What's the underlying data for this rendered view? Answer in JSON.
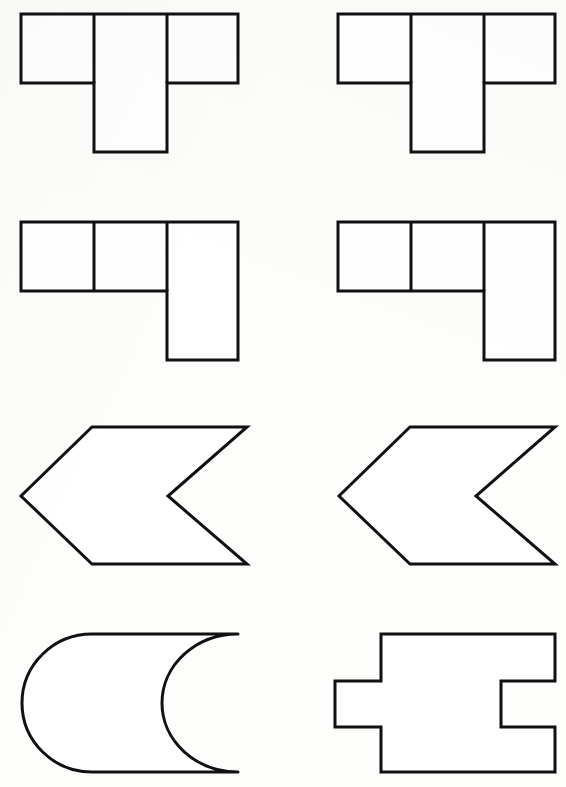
{
  "document": {
    "title": "Geometric Shape Worksheet",
    "background_color": "#fdfdfb",
    "stroke_color": "#111111",
    "fill_color": "#ffffff",
    "stroke_width": 3,
    "width": 566,
    "height": 787,
    "layout": "2 columns x 4 rows of line-drawn outline figures"
  },
  "figures": [
    {
      "id": "figure-r1c1",
      "name": "t-pentomino-outline",
      "label": "T-shaped tetromino: three squares in a row with one square below the center square",
      "row": 1,
      "column": 1,
      "shape_type": "polyomino",
      "cell_size": 72,
      "grid_cells": [
        [
          0,
          0
        ],
        [
          1,
          0
        ],
        [
          2,
          0
        ],
        [
          1,
          1
        ]
      ],
      "outline_points": "21,14 238,14 238,83 167,83 167,152 94,152 94,83 21,83",
      "interior_lines": [
        "94,14 94,83",
        "167,14 167,83"
      ]
    },
    {
      "id": "figure-r1c2",
      "name": "t-pentomino-outline",
      "label": "T-shaped tetromino: three squares in a row with one square below the center square",
      "row": 1,
      "column": 2,
      "shape_type": "polyomino",
      "cell_size": 72,
      "grid_cells": [
        [
          0,
          0
        ],
        [
          1,
          0
        ],
        [
          2,
          0
        ],
        [
          1,
          1
        ]
      ],
      "outline_points": "338,14 555,14 555,83 484,83 484,152 411,152 411,83 338,83",
      "interior_lines": [
        "411,14 411,83",
        "484,14 484,83"
      ]
    },
    {
      "id": "figure-r2c1",
      "name": "l-tetromino-outline",
      "label": "L-shaped tetromino: three squares in a row with one square below the rightmost square",
      "row": 2,
      "column": 1,
      "shape_type": "polyomino",
      "cell_size": 70,
      "grid_cells": [
        [
          0,
          0
        ],
        [
          1,
          0
        ],
        [
          2,
          0
        ],
        [
          2,
          1
        ]
      ],
      "outline_points": "21,222 238,222 238,360 167,360 167,291 21,291",
      "interior_lines": [
        "94,222 94,291",
        "167,222 167,291"
      ]
    },
    {
      "id": "figure-r2c2",
      "name": "l-tetromino-outline",
      "label": "L-shaped tetromino: three squares in a row with one square below the rightmost square",
      "row": 2,
      "column": 2,
      "shape_type": "polyomino",
      "cell_size": 70,
      "grid_cells": [
        [
          0,
          0
        ],
        [
          1,
          0
        ],
        [
          2,
          0
        ],
        [
          2,
          1
        ]
      ],
      "outline_points": "338,222 555,222 555,360 484,360 484,291 338,291",
      "interior_lines": [
        "411,222 411,291",
        "484,222 484,291"
      ]
    },
    {
      "id": "figure-r3c1",
      "name": "left-chevron-arrow-outline",
      "label": "Left-pointing chevron arrow with a V-shaped notch cut into its right edge",
      "row": 3,
      "column": 1,
      "shape_type": "polygon",
      "outline_points": "92,427 247,427 168,496 247,564 92,564 21,496"
    },
    {
      "id": "figure-r3c2",
      "name": "left-chevron-arrow-outline",
      "label": "Left-pointing chevron arrow with a V-shaped notch cut into its right edge",
      "row": 3,
      "column": 2,
      "shape_type": "polygon",
      "outline_points": "410,427 555,427 476,496 555,564 410,564 339,496"
    },
    {
      "id": "figure-r4c1",
      "name": "curved-chevron-outline",
      "label": "Curved version of the chevron: rounded semicircular left end with a concave crescent bite removed from the right edge",
      "row": 4,
      "column": 1,
      "shape_type": "curved-path",
      "path": "M 238 634 L 92 634 A 70 69 0 0 0 92 772 L 238 772 A 76 69 0 0 1 238 634 Z"
    },
    {
      "id": "figure-r4c2",
      "name": "jigsaw-piece-outline",
      "label": "Rectangle with a rectangular tab projecting from the left side and a matching rectangular notch cut into the right side",
      "row": 4,
      "column": 2,
      "shape_type": "polygon",
      "outline_points": "381,634 555,634 555,681 501,681 501,727 555,727 555,772 381,772 381,727 335,727 335,681 381,681"
    }
  ],
  "summary": {
    "figure_count": 8,
    "rows": 4,
    "columns": 2,
    "row_descriptions": [
      "Row 1: two identical T-shaped polyomino outlines",
      "Row 2: two identical L-shaped polyomino outlines",
      "Row 3: two identical left-pointing chevron arrow outlines",
      "Row 4: a curved chevron outline and a jigsaw puzzle piece outline"
    ]
  }
}
